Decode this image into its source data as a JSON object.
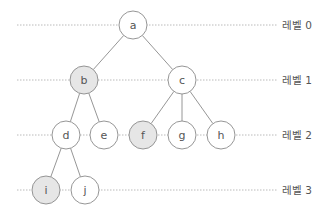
{
  "diagram": {
    "title": "",
    "colors": {
      "node_fill": "#ffffff",
      "node_highlight_fill": "#e6e6e6",
      "stroke": "#8a8a8a",
      "text": "#555555",
      "level_line": "#a8a8a8"
    },
    "levels": [
      {
        "label": "레벨 0",
        "y": 25
      },
      {
        "label": "레벨 1",
        "y": 80
      },
      {
        "label": "레벨 2",
        "y": 135
      },
      {
        "label": "레벨 3",
        "y": 190
      }
    ],
    "nodes": [
      {
        "id": "a",
        "label": "a",
        "x": 133,
        "y": 25,
        "level": 0,
        "highlighted": false
      },
      {
        "id": "b",
        "label": "b",
        "x": 84,
        "y": 80,
        "level": 1,
        "highlighted": true
      },
      {
        "id": "c",
        "label": "c",
        "x": 182,
        "y": 80,
        "level": 1,
        "highlighted": false
      },
      {
        "id": "d",
        "label": "d",
        "x": 66,
        "y": 135,
        "level": 2,
        "highlighted": false
      },
      {
        "id": "e",
        "label": "e",
        "x": 104,
        "y": 135,
        "level": 2,
        "highlighted": false
      },
      {
        "id": "f",
        "label": "f",
        "x": 143,
        "y": 135,
        "level": 2,
        "highlighted": true
      },
      {
        "id": "g",
        "label": "g",
        "x": 182,
        "y": 135,
        "level": 2,
        "highlighted": false
      },
      {
        "id": "h",
        "label": "h",
        "x": 221,
        "y": 135,
        "level": 2,
        "highlighted": false
      },
      {
        "id": "i",
        "label": "i",
        "x": 46,
        "y": 190,
        "level": 3,
        "highlighted": true
      },
      {
        "id": "j",
        "label": "j",
        "x": 85,
        "y": 190,
        "level": 3,
        "highlighted": false
      }
    ],
    "edges": [
      {
        "from": "a",
        "to": "b"
      },
      {
        "from": "a",
        "to": "c"
      },
      {
        "from": "b",
        "to": "d"
      },
      {
        "from": "b",
        "to": "e"
      },
      {
        "from": "c",
        "to": "f"
      },
      {
        "from": "c",
        "to": "g"
      },
      {
        "from": "c",
        "to": "h"
      },
      {
        "from": "d",
        "to": "i"
      },
      {
        "from": "d",
        "to": "j"
      }
    ]
  }
}
